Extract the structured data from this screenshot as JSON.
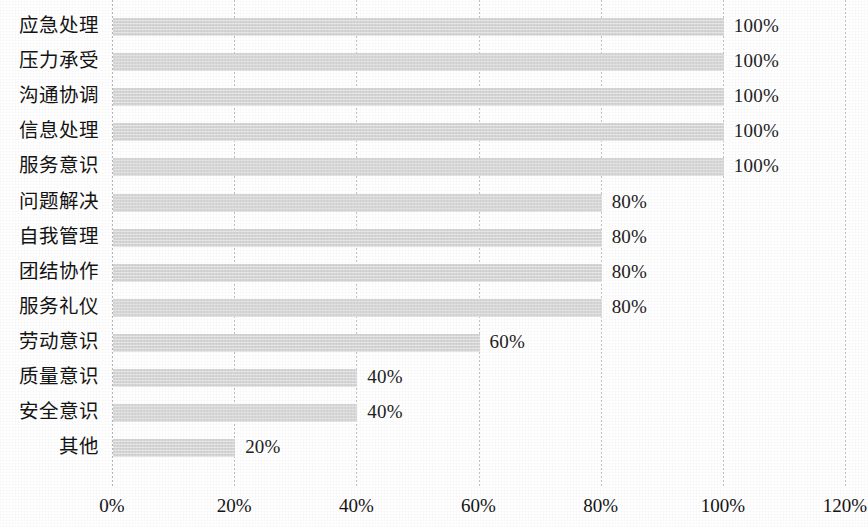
{
  "chart_data": {
    "type": "bar",
    "orientation": "horizontal",
    "title": "",
    "subtitle": "",
    "xlabel": "",
    "ylabel": "",
    "xlim": [
      0,
      120
    ],
    "xtick_labels": [
      "0%",
      "20%",
      "40%",
      "60%",
      "80%",
      "100%",
      "120%"
    ],
    "xticks": [
      0,
      20,
      40,
      60,
      80,
      100,
      120
    ],
    "grid": "vertical-dotted",
    "legend": "none",
    "bar_color": "#d9d9d9",
    "value_label_suffix": "%",
    "categories": [
      "应急处理",
      "压力承受",
      "沟通协调",
      "信息处理",
      "服务意识",
      "问题解决",
      "自我管理",
      "团结协作",
      "服务礼仪",
      "劳动意识",
      "质量意识",
      "安全意识",
      "其他"
    ],
    "values": [
      100,
      100,
      100,
      100,
      100,
      80,
      80,
      80,
      80,
      60,
      40,
      40,
      20
    ],
    "value_labels": [
      "100%",
      "100%",
      "100%",
      "100%",
      "100%",
      "80%",
      "80%",
      "80%",
      "80%",
      "60%",
      "40%",
      "40%",
      "20%"
    ]
  }
}
